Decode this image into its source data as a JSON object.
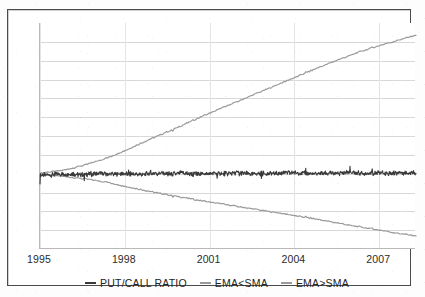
{
  "chart_data": {
    "type": "line",
    "title": "",
    "subtitle": "",
    "xlabel": "",
    "ylabel": "",
    "grid": true,
    "grid_horizontal_lines": 11,
    "legend_position": "bottom-center",
    "xlim": [
      1995,
      2008.3
    ],
    "ylim": [
      0,
      1
    ],
    "xticks": [
      1995,
      1998,
      2001,
      2004,
      2007
    ],
    "xticklabels": [
      "1995",
      "1998",
      "2001",
      "2004",
      "2007"
    ],
    "yticklabels": [],
    "series": [
      {
        "name": "PUT/CALL RATIO",
        "color": "#3a3a3a",
        "style": "noisy-flat",
        "x": [
          1995.0,
          1995.5,
          1996.0,
          1996.5,
          1997.0,
          1997.5,
          1998.0,
          1998.5,
          1999.0,
          1999.5,
          2000.0,
          2000.5,
          2001.0,
          2001.5,
          2002.0,
          2002.5,
          2003.0,
          2003.5,
          2004.0,
          2004.5,
          2005.0,
          2005.5,
          2006.0,
          2006.5,
          2007.0,
          2007.5,
          2008.0,
          2008.3
        ],
        "values": [
          0.327,
          0.33,
          0.332,
          0.329,
          0.334,
          0.331,
          0.333,
          0.33,
          0.335,
          0.332,
          0.336,
          0.331,
          0.334,
          0.333,
          0.337,
          0.332,
          0.335,
          0.334,
          0.338,
          0.333,
          0.336,
          0.335,
          0.339,
          0.334,
          0.337,
          0.336,
          0.338,
          0.337
        ]
      },
      {
        "name": "EMA<SMA",
        "color": "#9a9a9a",
        "style": "descending",
        "x": [
          1995.0,
          1995.8,
          1996.6,
          1997.4,
          1998.2,
          1999.0,
          1999.8,
          2000.6,
          2001.4,
          2002.2,
          2003.0,
          2003.8,
          2004.6,
          2005.4,
          2006.2,
          2007.0,
          2007.8,
          2008.3
        ],
        "values": [
          0.33,
          0.322,
          0.31,
          0.295,
          0.272,
          0.252,
          0.234,
          0.216,
          0.2,
          0.184,
          0.168,
          0.152,
          0.136,
          0.118,
          0.1,
          0.084,
          0.066,
          0.058
        ]
      },
      {
        "name": "EMA>SMA",
        "color": "#9a9a9a",
        "style": "ascending",
        "x": [
          1995.0,
          1995.8,
          1996.6,
          1997.4,
          1998.2,
          1999.0,
          1999.8,
          2000.6,
          2001.4,
          2002.2,
          2003.0,
          2003.8,
          2004.6,
          2005.4,
          2006.2,
          2007.0,
          2007.8,
          2008.3
        ],
        "values": [
          0.336,
          0.348,
          0.372,
          0.404,
          0.446,
          0.492,
          0.534,
          0.58,
          0.622,
          0.664,
          0.706,
          0.748,
          0.79,
          0.83,
          0.868,
          0.9,
          0.928,
          0.946
        ]
      }
    ],
    "legend": [
      {
        "label": "PUT/CALL RATIO",
        "color": "#3a3a3a"
      },
      {
        "label": "EMA<SMA",
        "color": "#9a9a9a"
      },
      {
        "label": "EMA>SMA",
        "color": "#9a9a9a"
      }
    ]
  },
  "axis": {
    "x_tick_labels": [
      "1995",
      "1998",
      "2001",
      "2004",
      "2007"
    ]
  },
  "colors": {
    "frame": "#4b4b4b",
    "gridline": "#d8d8d8",
    "axis": "#b9b9b9",
    "ratio_series": "#3a3a3a",
    "ema_series": "#9a9a9a",
    "background": "#ffffff",
    "text": "#242424"
  }
}
